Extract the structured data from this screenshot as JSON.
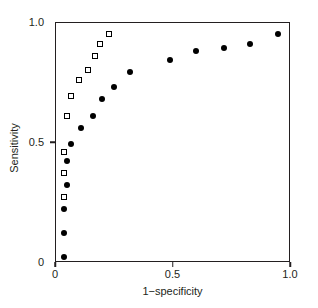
{
  "chart_data": {
    "type": "scatter",
    "title": "",
    "xlabel": "1−specificity",
    "ylabel": "Sensitivity",
    "xlim": [
      0,
      1.0
    ],
    "ylim": [
      0,
      1.0
    ],
    "grid": false,
    "legend": "none",
    "xticks": [
      {
        "value": 0,
        "label": "0"
      },
      {
        "value": 0.5,
        "label": "0.5"
      },
      {
        "value": 1.0,
        "label": "1.0"
      }
    ],
    "yticks": [
      {
        "value": 0,
        "label": "0"
      },
      {
        "value": 0.5,
        "label": "0.5"
      },
      {
        "value": 1.0,
        "label": "1.0"
      }
    ],
    "series": [
      {
        "name": "filled-circles",
        "marker": "filled-circle",
        "color": "#000000",
        "points": [
          [
            0.04,
            0.02
          ],
          [
            0.04,
            0.12
          ],
          [
            0.04,
            0.22
          ],
          [
            0.05,
            0.32
          ],
          [
            0.05,
            0.42
          ],
          [
            0.07,
            0.49
          ],
          [
            0.11,
            0.56
          ],
          [
            0.16,
            0.61
          ],
          [
            0.2,
            0.68
          ],
          [
            0.25,
            0.73
          ],
          [
            0.32,
            0.79
          ],
          [
            0.49,
            0.84
          ],
          [
            0.6,
            0.88
          ],
          [
            0.72,
            0.89
          ],
          [
            0.83,
            0.91
          ],
          [
            0.95,
            0.95
          ]
        ]
      },
      {
        "name": "open-squares",
        "marker": "open-square",
        "color": "#000000",
        "points": [
          [
            0.04,
            0.27
          ],
          [
            0.04,
            0.37
          ],
          [
            0.04,
            0.46
          ],
          [
            0.05,
            0.61
          ],
          [
            0.07,
            0.69
          ],
          [
            0.1,
            0.76
          ],
          [
            0.14,
            0.8
          ],
          [
            0.17,
            0.86
          ],
          [
            0.19,
            0.91
          ],
          [
            0.23,
            0.95
          ]
        ]
      }
    ]
  }
}
